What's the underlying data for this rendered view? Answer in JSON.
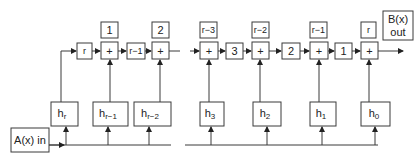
{
  "diagram": {
    "type": "shift-register filter (polynomial multiplication circuit)",
    "input": {
      "label": "A(x) in"
    },
    "output": {
      "label_line1": "B(x)",
      "label_line2": "out"
    },
    "top_row": {
      "feedback_delay": "r",
      "adders": [
        {
          "symbol": "+",
          "index_label": "1"
        },
        {
          "symbol": "+",
          "index_label": "2"
        },
        {
          "symbol": "+",
          "index_label": "r−3"
        },
        {
          "symbol": "+",
          "index_label": "r−2"
        },
        {
          "symbol": "+",
          "index_label": "r−1"
        },
        {
          "symbol": "+",
          "index_label": "r"
        }
      ],
      "delays": [
        "r−1",
        "3",
        "2",
        "1"
      ]
    },
    "coefficients": [
      {
        "base": "h",
        "sub": "r"
      },
      {
        "base": "h",
        "sub": "r−1"
      },
      {
        "base": "h",
        "sub": "r−2"
      },
      {
        "base": "h",
        "sub": "3"
      },
      {
        "base": "h",
        "sub": "2"
      },
      {
        "base": "h",
        "sub": "1"
      },
      {
        "base": "h",
        "sub": "0"
      }
    ]
  }
}
